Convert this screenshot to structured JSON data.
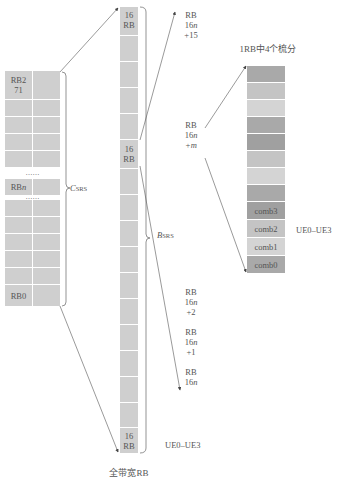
{
  "left_block": {
    "top_label_line1": "RB2",
    "top_label_line2": "71",
    "middle_label_prefix": "RB",
    "middle_label_var": "n",
    "bottom_label": "RB0",
    "ellipsis": "……",
    "brace_label_main": "C",
    "brace_label_sub": "SRS",
    "fill_color": "#cfcfcf"
  },
  "middle_column": {
    "segments": [
      {
        "line1": "16",
        "line2": "RB"
      },
      {
        "line1": "16",
        "line2": "RB"
      },
      {
        "line1": "16",
        "line2": "RB"
      }
    ],
    "brace_label_main": "B",
    "brace_label_sub": "SRS",
    "caption": "全带宽RB",
    "ue_label": "UE0–UE3",
    "fill_color": "#d2d2d2"
  },
  "rb_labels": [
    {
      "line1": "RB",
      "line2_num": "16",
      "line2_var": "n",
      "line3": "+15"
    },
    {
      "line1": "RB",
      "line2_num": "16",
      "line2_var": "n",
      "line3_var": "+m"
    },
    {
      "line1": "RB",
      "line2_num": "16",
      "line2_var": "n",
      "line3": "+2"
    },
    {
      "line1": "RB",
      "line2_num": "16",
      "line2_var": "n",
      "line3": "+1"
    },
    {
      "line1": "RB",
      "line2_num": "16",
      "line2_var": "n",
      "line3": ""
    }
  ],
  "comb_column": {
    "title": "1RB中4个梳分",
    "cells": [
      {
        "label": "",
        "color": "#a9a9a9"
      },
      {
        "label": "",
        "color": "#c4c4c4"
      },
      {
        "label": "",
        "color": "#d4d4d4"
      },
      {
        "label": "",
        "color": "#a9a9a9"
      },
      {
        "label": "",
        "color": "#a0a0a0"
      },
      {
        "label": "",
        "color": "#c4c4c4"
      },
      {
        "label": "",
        "color": "#d4d4d4"
      },
      {
        "label": "",
        "color": "#a9a9a9"
      },
      {
        "label": "comb3",
        "color": "#a0a0a0"
      },
      {
        "label": "comb2",
        "color": "#c4c4c4"
      },
      {
        "label": "comb1",
        "color": "#d4d4d4"
      },
      {
        "label": "comb0",
        "color": "#a9a9a9"
      }
    ],
    "ue_label": "UE0–UE3"
  }
}
